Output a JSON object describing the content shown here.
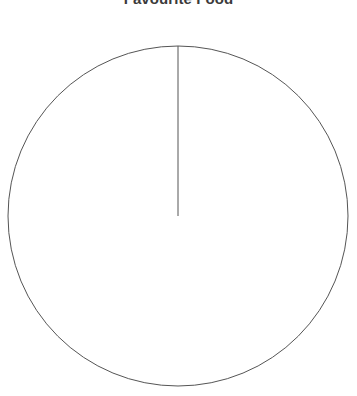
{
  "figure": {
    "title": "Favourite Food",
    "background_color": "#ffffff",
    "title_color": "#3b3b3b",
    "width": 357,
    "height": 396
  },
  "chart_data": {
    "type": "pie",
    "title": "Favourite Food",
    "xlabel": "",
    "ylabel": "",
    "categories": [],
    "values": [],
    "labels_shown": false,
    "legend": false,
    "legend_position": "none",
    "grid": false,
    "total": 0,
    "geometry": {
      "center_x": 178,
      "center_y": 216,
      "radius": 170,
      "start_angle_deg": 90,
      "wedge_count": 0,
      "outline_color": "#555555",
      "outline_width": 1,
      "fill_color": "#ffffff",
      "divider_color": "#555555",
      "divider_width": 1,
      "clipped_at_bottom": true
    }
  }
}
